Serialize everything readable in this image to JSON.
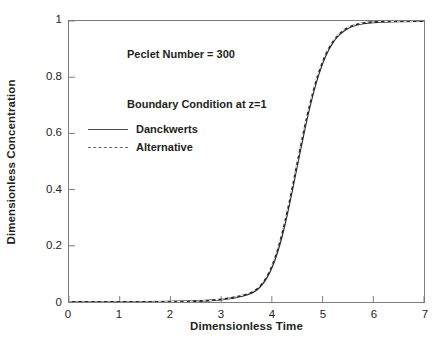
{
  "chart_data": {
    "type": "line",
    "title": "",
    "xlabel": "Dimensionless Time",
    "ylabel": "Dimensionless Concentration",
    "xlim": [
      0,
      7
    ],
    "ylim": [
      0,
      1
    ],
    "grid": false,
    "xticks": [
      "0",
      "1",
      "2",
      "3",
      "4",
      "5",
      "6",
      "7"
    ],
    "yticks": [
      "0",
      "0.2",
      "0.4",
      "0.6",
      "0.8",
      "1"
    ],
    "xtick_values": [
      0,
      1,
      2,
      3,
      4,
      5,
      6,
      7
    ],
    "ytick_values": [
      0,
      0.2,
      0.4,
      0.6,
      0.8,
      1
    ],
    "annotations": [
      {
        "text": "Peclet Number = 300",
        "x": 1.15,
        "y": 0.9
      },
      {
        "text": "Boundary Condition at z=1",
        "x": 1.15,
        "y": 0.72
      }
    ],
    "legend_position": "upper-left-inside",
    "series": [
      {
        "name": "Danckwerts",
        "style": "solid",
        "color": "#2b2b2b",
        "x": [
          0,
          0.5,
          1,
          1.5,
          2,
          2.5,
          2.8,
          3,
          3.2,
          3.4,
          3.6,
          3.7,
          3.8,
          3.9,
          4,
          4.1,
          4.2,
          4.3,
          4.4,
          4.5,
          4.6,
          4.7,
          4.8,
          4.9,
          5,
          5.1,
          5.2,
          5.3,
          5.4,
          5.5,
          5.6,
          5.8,
          6,
          6.5,
          7
        ],
        "y": [
          0,
          0,
          0,
          0,
          0.001,
          0.003,
          0.006,
          0.009,
          0.014,
          0.021,
          0.033,
          0.044,
          0.062,
          0.088,
          0.125,
          0.175,
          0.238,
          0.315,
          0.4,
          0.49,
          0.578,
          0.662,
          0.736,
          0.8,
          0.852,
          0.893,
          0.924,
          0.947,
          0.963,
          0.975,
          0.983,
          0.992,
          0.996,
          0.999,
          1
        ]
      },
      {
        "name": "Alternative",
        "style": "dashed",
        "color": "#2b2b2b",
        "x": [
          0,
          0.5,
          1,
          1.5,
          2,
          2.5,
          2.8,
          3,
          3.2,
          3.4,
          3.6,
          3.7,
          3.8,
          3.9,
          4,
          4.1,
          4.2,
          4.3,
          4.4,
          4.5,
          4.6,
          4.7,
          4.8,
          4.9,
          5,
          5.1,
          5.2,
          5.3,
          5.4,
          5.5,
          5.6,
          5.8,
          6,
          6.5,
          7
        ],
        "y": [
          0,
          0,
          0,
          0,
          0.001,
          0.003,
          0.006,
          0.01,
          0.015,
          0.023,
          0.036,
          0.048,
          0.067,
          0.094,
          0.132,
          0.184,
          0.248,
          0.326,
          0.411,
          0.5,
          0.588,
          0.671,
          0.744,
          0.807,
          0.858,
          0.898,
          0.928,
          0.95,
          0.966,
          0.977,
          0.985,
          0.993,
          0.997,
          0.999,
          1
        ]
      }
    ]
  },
  "axes": {
    "x_title": "Dimensionless Time",
    "y_title": "Dimensionless Concentration"
  },
  "annotations": {
    "peclet": "Peclet Number = 300",
    "legend_title": "Boundary Condition at z=1"
  },
  "legend": {
    "entries": [
      {
        "label": "Danckwerts",
        "style": "solid"
      },
      {
        "label": "Alternative",
        "style": "dashed"
      }
    ]
  },
  "caption": {
    "text": ""
  }
}
